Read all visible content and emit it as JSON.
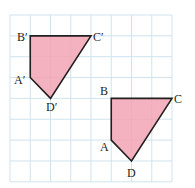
{
  "grid": {
    "cols": 8,
    "rows": 8,
    "x0": 10,
    "y0": 15,
    "cell_w": 20.25,
    "cell_h": 20.85,
    "line_color": "#cfe3ef"
  },
  "style": {
    "fill": "#f2a3b4",
    "fill_opacity": 0.85,
    "stroke": "#231f20"
  },
  "shapes": [
    {
      "name": "image-quadrilateral",
      "vertices": [
        {
          "label": "A′",
          "gx": 1,
          "gy": 3
        },
        {
          "label": "B′",
          "gx": 1,
          "gy": 1
        },
        {
          "label": "C′",
          "gx": 4,
          "gy": 1
        },
        {
          "label": "D′",
          "gx": 2,
          "gy": 4
        }
      ]
    },
    {
      "name": "original-quadrilateral",
      "vertices": [
        {
          "label": "A",
          "gx": 5,
          "gy": 6
        },
        {
          "label": "B",
          "gx": 5,
          "gy": 4
        },
        {
          "label": "C",
          "gx": 8,
          "gy": 4
        },
        {
          "label": "D",
          "gx": 6,
          "gy": 7
        }
      ]
    }
  ],
  "labels": {
    "A_prime": "A′",
    "B_prime": "B′",
    "C_prime": "C′",
    "D_prime": "D′",
    "A": "A",
    "B": "B",
    "C": "C",
    "D": "D"
  }
}
